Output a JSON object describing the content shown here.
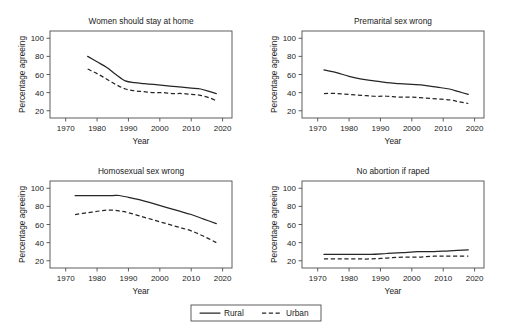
{
  "figure": {
    "width": 512,
    "height": 333,
    "background": "#ffffff",
    "line_color": "#262626",
    "axis_color": "#4d4d4d"
  },
  "legend": {
    "position": "bottom-center",
    "entries": [
      {
        "label": "Rural",
        "style": "solid"
      },
      {
        "label": "Urban",
        "style": "dashed"
      }
    ]
  },
  "chart_data": [
    {
      "type": "line",
      "title": "Women should stay at home",
      "xlabel": "Year",
      "ylabel": "Percentage agreeing",
      "xlim": [
        1965,
        2023
      ],
      "ylim": [
        12,
        108
      ],
      "xticks": [
        1970,
        1980,
        1990,
        2000,
        2010,
        2020
      ],
      "yticks": [
        20,
        40,
        60,
        80,
        100
      ],
      "grid": false,
      "series": [
        {
          "name": "Rural",
          "style": "solid",
          "x": [
            1977,
            1980,
            1983,
            1986,
            1989,
            1992,
            1995,
            1998,
            2001,
            2004,
            2007,
            2010,
            2013,
            2016,
            2018
          ],
          "values": [
            80,
            74,
            68,
            60,
            53,
            51,
            50,
            49,
            48,
            47,
            46,
            45,
            44,
            41,
            39
          ]
        },
        {
          "name": "Urban",
          "style": "dashed",
          "x": [
            1977,
            1980,
            1983,
            1986,
            1989,
            1992,
            1995,
            1998,
            2001,
            2004,
            2007,
            2010,
            2013,
            2016,
            2018
          ],
          "values": [
            66,
            61,
            55,
            49,
            44,
            42,
            41,
            40,
            40,
            39,
            39,
            38,
            37,
            34,
            31
          ]
        }
      ]
    },
    {
      "type": "line",
      "title": "Premarital sex wrong",
      "xlabel": "Year",
      "ylabel": "Percentage agreeing",
      "xlim": [
        1965,
        2023
      ],
      "ylim": [
        12,
        108
      ],
      "xticks": [
        1970,
        1980,
        1990,
        2000,
        2010,
        2020
      ],
      "yticks": [
        20,
        40,
        60,
        80,
        100
      ],
      "grid": false,
      "series": [
        {
          "name": "Rural",
          "style": "solid",
          "x": [
            1972,
            1976,
            1980,
            1984,
            1988,
            1992,
            1996,
            2000,
            2004,
            2008,
            2012,
            2015,
            2018
          ],
          "values": [
            65,
            62,
            58,
            55,
            53,
            51,
            50,
            49,
            48,
            46,
            44,
            41,
            38
          ]
        },
        {
          "name": "Urban",
          "style": "dashed",
          "x": [
            1972,
            1976,
            1980,
            1984,
            1988,
            1992,
            1996,
            2000,
            2004,
            2008,
            2012,
            2015,
            2018
          ],
          "values": [
            39,
            39,
            38,
            37,
            36,
            36,
            35,
            35,
            34,
            33,
            32,
            30,
            28
          ]
        }
      ]
    },
    {
      "type": "line",
      "title": "Homosexual sex wrong",
      "xlabel": "Year",
      "ylabel": "Percentage agreeing",
      "xlim": [
        1965,
        2023
      ],
      "ylim": [
        12,
        108
      ],
      "xticks": [
        1970,
        1980,
        1990,
        2000,
        2010,
        2020
      ],
      "yticks": [
        20,
        40,
        60,
        80,
        100
      ],
      "grid": false,
      "series": [
        {
          "name": "Rural",
          "style": "solid",
          "x": [
            1973,
            1977,
            1981,
            1985,
            1987,
            1990,
            1994,
            1998,
            2002,
            2006,
            2010,
            2014,
            2018
          ],
          "values": [
            92,
            92,
            92,
            92,
            92,
            90,
            87,
            83,
            79,
            75,
            71,
            66,
            61
          ]
        },
        {
          "name": "Urban",
          "style": "dashed",
          "x": [
            1973,
            1977,
            1981,
            1984,
            1987,
            1990,
            1994,
            1998,
            2002,
            2006,
            2010,
            2014,
            2018
          ],
          "values": [
            71,
            73,
            75,
            76,
            75,
            73,
            69,
            65,
            61,
            57,
            53,
            47,
            40
          ]
        }
      ]
    },
    {
      "type": "line",
      "title": "No abortion if raped",
      "xlabel": "Year",
      "ylabel": "Percentage agreeing",
      "xlim": [
        1965,
        2023
      ],
      "ylim": [
        12,
        108
      ],
      "xticks": [
        1970,
        1980,
        1990,
        2000,
        2010,
        2020
      ],
      "yticks": [
        20,
        40,
        60,
        80,
        100
      ],
      "grid": false,
      "series": [
        {
          "name": "Rural",
          "style": "solid",
          "x": [
            1972,
            1977,
            1982,
            1987,
            1992,
            1997,
            2002,
            2007,
            2012,
            2018
          ],
          "values": [
            27,
            27,
            27,
            27,
            28,
            29,
            30,
            30,
            31,
            32
          ]
        },
        {
          "name": "Urban",
          "style": "dashed",
          "x": [
            1972,
            1977,
            1982,
            1987,
            1992,
            1997,
            2002,
            2007,
            2012,
            2018
          ],
          "values": [
            22,
            22,
            22,
            22,
            23,
            24,
            24,
            25,
            25,
            25
          ]
        }
      ]
    }
  ]
}
